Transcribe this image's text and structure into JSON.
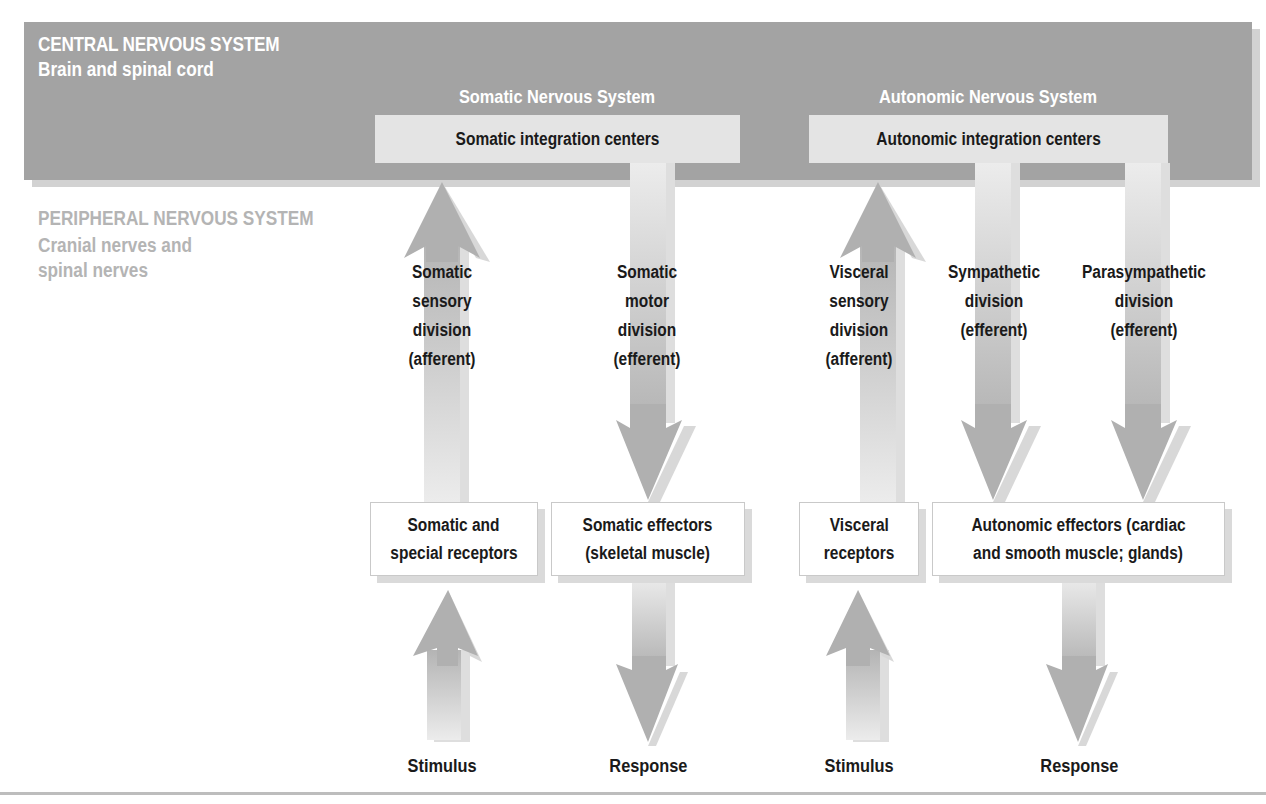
{
  "cns": {
    "title": "CENTRAL NERVOUS SYSTEM",
    "subtitle": "Brain and spinal cord",
    "somatic_heading": "Somatic Nervous System",
    "autonomic_heading": "Autonomic Nervous System",
    "somatic_integration": "Somatic integration centers",
    "autonomic_integration": "Autonomic integration centers"
  },
  "pns": {
    "title": "PERIPHERAL NERVOUS SYSTEM",
    "subtitle_lines": [
      "Cranial nerves and",
      "spinal nerves"
    ]
  },
  "divisions": [
    {
      "lines": [
        "Somatic",
        "sensory",
        "division",
        "(afferent)"
      ],
      "direction": "up"
    },
    {
      "lines": [
        "Somatic",
        "motor",
        "division",
        "(efferent)"
      ],
      "direction": "down"
    },
    {
      "lines": [
        "Visceral",
        "sensory",
        "division",
        "(afferent)"
      ],
      "direction": "up"
    },
    {
      "lines": [
        "Sympathetic",
        "division",
        "(efferent)"
      ],
      "direction": "down"
    },
    {
      "lines": [
        "Parasympathetic",
        "division",
        "(efferent)"
      ],
      "direction": "down"
    }
  ],
  "peripheral_boxes": [
    {
      "lines": [
        "Somatic and",
        "special receptors"
      ]
    },
    {
      "lines": [
        "Somatic effectors",
        "(skeletal muscle)"
      ]
    },
    {
      "lines": [
        "Visceral",
        "receptors"
      ]
    },
    {
      "lines": [
        "Autonomic effectors (cardiac",
        "and smooth muscle; glands)"
      ]
    }
  ],
  "endpoints": [
    "Stimulus",
    "Response",
    "Stimulus",
    "Response"
  ],
  "colors": {
    "cns_band": "#a3a3a3",
    "integration_box": "#e4e4e4",
    "arrow": "#b0b0b0",
    "pns_text": "#b4b4b4"
  }
}
